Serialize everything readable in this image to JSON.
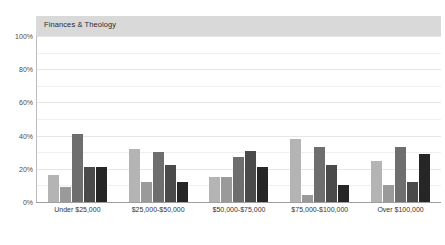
{
  "chart": {
    "title": "Finances & Theology",
    "banner_color": "#d9d9d9"
  },
  "chart_data": {
    "type": "bar",
    "title": "Finances & Theology",
    "xlabel": "",
    "ylabel": "",
    "ylim": [
      0,
      100
    ],
    "ytick_labels": [
      "0%",
      "20%",
      "40%",
      "60%",
      "80%",
      "100%"
    ],
    "ytick_values": [
      0,
      20,
      40,
      60,
      80,
      100
    ],
    "grid": true,
    "legend": "none",
    "categories": [
      "Under $25,000",
      "$25,000-$50,000",
      "$50,000-$75,000",
      "$75,000-$100,000",
      "Over $100,000"
    ],
    "series": [
      {
        "name": "series-1",
        "color": "#b4b4b4",
        "values": [
          16,
          32,
          15,
          38,
          25
        ]
      },
      {
        "name": "series-2",
        "color": "#9a9a9a",
        "values": [
          9,
          12,
          15,
          4,
          10
        ]
      },
      {
        "name": "series-3",
        "color": "#6e6e6e",
        "values": [
          41,
          30,
          27,
          33,
          33
        ]
      },
      {
        "name": "series-4",
        "color": "#4a4a4a",
        "values": [
          21,
          22,
          31,
          22,
          12
        ]
      },
      {
        "name": "series-5",
        "color": "#262626",
        "values": [
          21,
          12,
          21,
          10,
          29
        ]
      }
    ]
  }
}
